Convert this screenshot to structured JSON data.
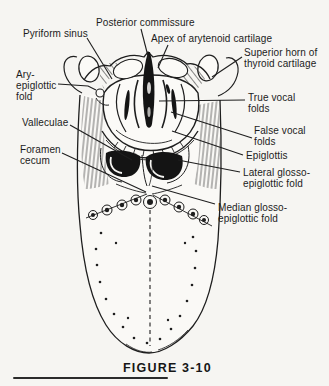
{
  "figure": {
    "caption": "FIGURE 3-10"
  },
  "colors": {
    "ink": "#1e1e1e",
    "paper": "#f6f5f2"
  },
  "labels": [
    {
      "id": "pyriform-sinus",
      "text": "Pyriform sinus"
    },
    {
      "id": "posterior-commissure",
      "text": "Posterior commissure"
    },
    {
      "id": "apex-of-arytenoid-cartilage",
      "text": "Apex of arytenoid cartilage"
    },
    {
      "id": "superior-horn-of-thyroid-cartilage",
      "text": "Superior horn of\nthyroid cartilage"
    },
    {
      "id": "ary-epiglottic-fold",
      "text": "Ary-\nepiglottic\nfold"
    },
    {
      "id": "true-vocal-folds",
      "text": "True vocal\nfolds"
    },
    {
      "id": "valleculae",
      "text": "Valleculae"
    },
    {
      "id": "false-vocal-folds",
      "text": "False vocal\nfolds"
    },
    {
      "id": "foramen-cecum",
      "text": "Foramen\ncecum"
    },
    {
      "id": "epiglottis",
      "text": "Epiglottis"
    },
    {
      "id": "lateral-glosso-epiglottic-fold",
      "text": "Lateral glosso-\nepiglottic fold"
    },
    {
      "id": "median-glosso-epiglottic-fold",
      "text": "Median glosso-\nepiglottic fold"
    }
  ]
}
